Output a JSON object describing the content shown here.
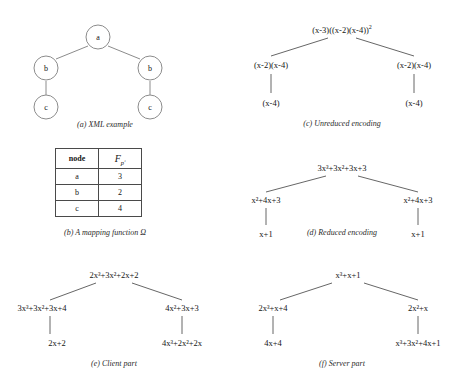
{
  "figure": {
    "panels": [
      {
        "id": "a",
        "caption": "(a) XML example",
        "type": "circle-tree",
        "nodes": [
          {
            "label": "a",
            "x": 98,
            "y": 29
          },
          {
            "label": "b",
            "x": 46,
            "y": 60
          },
          {
            "label": "b",
            "x": 150,
            "y": 60
          },
          {
            "label": "c",
            "x": 46,
            "y": 99
          },
          {
            "label": "c",
            "x": 150,
            "y": 99
          }
        ],
        "edges": [
          [
            0,
            1
          ],
          [
            0,
            2
          ],
          [
            1,
            3
          ],
          [
            2,
            4
          ]
        ]
      },
      {
        "id": "b",
        "caption": "(b) A mapping function Ω",
        "type": "table",
        "columns": [
          "node",
          "F"
        ],
        "column_2_symbol": "F",
        "column_2_subscript": "pʹ",
        "rows": [
          {
            "node": "a",
            "value": "3"
          },
          {
            "node": "b",
            "value": "2"
          },
          {
            "node": "c",
            "value": "4"
          }
        ]
      },
      {
        "id": "c",
        "caption": "(c) Unreduced encoding",
        "type": "expr-tree",
        "nodes": [
          {
            "label": "(x-3)((x-2)(x-4))",
            "sup": "2",
            "x": 114,
            "y": 22
          },
          {
            "label": "(x-2)(x-4)",
            "sup": "",
            "x": 43,
            "y": 57
          },
          {
            "label": "(x-2)(x-4)",
            "sup": "",
            "x": 186,
            "y": 57
          },
          {
            "label": "(x-4)",
            "sup": "",
            "x": 43,
            "y": 95
          },
          {
            "label": "(x-4)",
            "sup": "",
            "x": 186,
            "y": 95
          }
        ],
        "edges": [
          [
            0,
            1
          ],
          [
            0,
            2
          ],
          [
            1,
            3
          ],
          [
            2,
            4
          ]
        ]
      },
      {
        "id": "d",
        "caption": "(d) Reduced encoding",
        "type": "expr-tree",
        "nodes": [
          {
            "label": "3x³+3x²+3x+3",
            "x": 114,
            "y": 20
          },
          {
            "label": "x²+4x+3",
            "x": 38,
            "y": 52
          },
          {
            "label": "x²+4x+3",
            "x": 190,
            "y": 52
          },
          {
            "label": "x+1",
            "x": 38,
            "y": 86
          },
          {
            "label": "x+1",
            "x": 190,
            "y": 86
          }
        ],
        "edges": [
          [
            0,
            1
          ],
          [
            0,
            2
          ],
          [
            1,
            3
          ],
          [
            2,
            4
          ]
        ]
      },
      {
        "id": "e",
        "caption": "(e) Client part",
        "type": "expr-tree",
        "nodes": [
          {
            "label": "2x³+3x²+2x+2",
            "x": 114,
            "y": 17
          },
          {
            "label": "3x³+3x²+3x+4",
            "x": 42,
            "y": 50
          },
          {
            "label": "4x²+3x+3",
            "x": 182,
            "y": 50
          },
          {
            "label": "2x+2",
            "x": 57,
            "y": 85
          },
          {
            "label": "4x³+2x²+2x",
            "x": 182,
            "y": 85
          }
        ],
        "edges": [
          [
            0,
            1
          ],
          [
            0,
            2
          ],
          [
            1,
            3
          ],
          [
            2,
            4
          ]
        ]
      },
      {
        "id": "f",
        "caption": "(f) Server part",
        "type": "expr-tree",
        "nodes": [
          {
            "label": "x³+x+1",
            "x": 120,
            "y": 17
          },
          {
            "label": "2x³+x+4",
            "x": 45,
            "y": 50
          },
          {
            "label": "2x²+x",
            "x": 190,
            "y": 50
          },
          {
            "label": "4x+4",
            "x": 45,
            "y": 85
          },
          {
            "label": "x³+3x²+4x+1",
            "x": 190,
            "y": 85
          }
        ],
        "edges": [
          [
            0,
            1
          ],
          [
            0,
            2
          ],
          [
            1,
            3
          ],
          [
            2,
            4
          ]
        ]
      }
    ]
  }
}
